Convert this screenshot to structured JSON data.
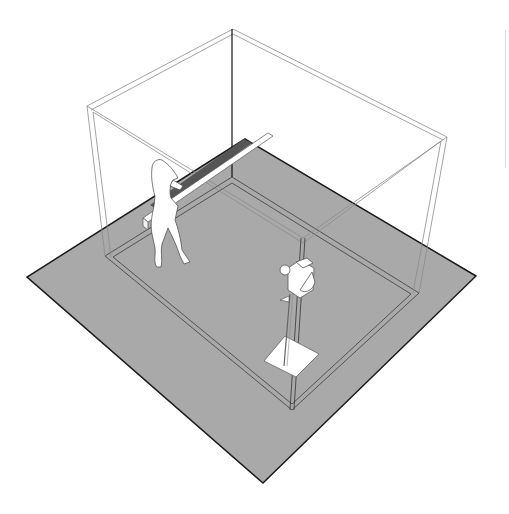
{
  "diagram": {
    "title": "Studio room setup",
    "elements": [
      {
        "id": "floor-slab",
        "label": "Floor slab"
      },
      {
        "id": "room-wireframe",
        "label": "Room walls (wireframe)"
      },
      {
        "id": "human-figure",
        "label": "Human figure"
      },
      {
        "id": "beam",
        "label": "Long beam / board"
      },
      {
        "id": "camera-stand",
        "label": "Camera on stand"
      }
    ],
    "colors": {
      "background": "#ffffff",
      "floor": "#a9a9a9",
      "floor_edge": "#1a1a1a",
      "wire": "#8c8c8c",
      "figure": "#ffffff"
    }
  }
}
